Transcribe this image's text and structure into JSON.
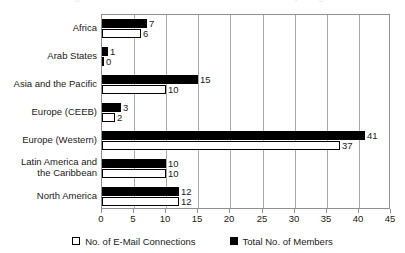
{
  "title_sliver": "Figure: E-Mail Connections and Members by Region",
  "colors": {
    "members": "#000000",
    "email": "#ffffff",
    "outline": "#000000",
    "grid": "#a7a7ad",
    "axis": "#8e8e93",
    "text": "#1a1a1a"
  },
  "legend": {
    "position": "bottom",
    "items": [
      {
        "label": "No. of E-Mail Connections",
        "marker": "open-square-marker",
        "key": "email"
      },
      {
        "label": "Total No. of Members",
        "marker": "filled-square-marker",
        "key": "members"
      }
    ]
  },
  "chart_data": {
    "type": "bar",
    "orientation": "horizontal",
    "title": "",
    "xlabel": "",
    "ylabel": "",
    "xlim": [
      0,
      45
    ],
    "xticks": [
      0,
      5,
      10,
      15,
      20,
      25,
      30,
      35,
      40,
      45
    ],
    "xticklabels": [
      "0",
      "5",
      "10",
      "15",
      "20",
      "25",
      "30",
      "35",
      "40",
      "45"
    ],
    "grid": "vertical",
    "categories": [
      "Africa",
      "Arab States",
      "Asia and the Pacific",
      "Europe (CEEB)",
      "Europe (Western)",
      "Latin America and the Caribbean",
      "North America"
    ],
    "category_lines": [
      [
        "Africa"
      ],
      [
        "Arab States"
      ],
      [
        "Asia and the Pacific"
      ],
      [
        "Europe (CEEB)"
      ],
      [
        "Europe (Western)"
      ],
      [
        "Latin America and",
        "the Caribbean"
      ],
      [
        "North America"
      ]
    ],
    "series": [
      {
        "name": "Total No. of Members",
        "key": "members",
        "values": [
          7,
          1,
          15,
          3,
          41,
          10,
          12
        ],
        "labels": [
          "7",
          "1",
          "15",
          "3",
          "41",
          "10",
          "12"
        ]
      },
      {
        "name": "No. of E-Mail Connections",
        "key": "email",
        "values": [
          6,
          0,
          10,
          2,
          37,
          10,
          12
        ],
        "labels": [
          "6",
          "0",
          "10",
          "2",
          "37",
          "10",
          "12"
        ]
      }
    ]
  }
}
